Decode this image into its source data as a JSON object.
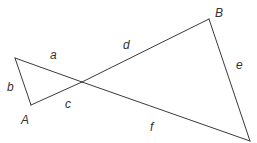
{
  "diagram": {
    "type": "crossed-triangles",
    "stroke_color": "#3a3a3a",
    "label_color": "#333333",
    "points": {
      "P": {
        "x": 15,
        "y": 58
      },
      "A": {
        "x": 31,
        "y": 105
      },
      "X": {
        "x": 82,
        "y": 82
      },
      "B": {
        "x": 209,
        "y": 19
      },
      "Q": {
        "x": 250,
        "y": 141
      }
    },
    "segments": [
      {
        "name": "a",
        "from": "P",
        "to": "X"
      },
      {
        "name": "b",
        "from": "P",
        "to": "A"
      },
      {
        "name": "c",
        "from": "A",
        "to": "X"
      },
      {
        "name": "d",
        "from": "X",
        "to": "B"
      },
      {
        "name": "e",
        "from": "B",
        "to": "Q"
      },
      {
        "name": "f",
        "from": "X",
        "to": "Q"
      }
    ],
    "labels": {
      "a": {
        "text": "a",
        "x": 50,
        "y": 59
      },
      "b": {
        "text": "b",
        "x": 7,
        "y": 91
      },
      "c": {
        "text": "c",
        "x": 65,
        "y": 108
      },
      "d": {
        "text": "d",
        "x": 123,
        "y": 49
      },
      "e": {
        "text": "e",
        "x": 236,
        "y": 69
      },
      "f": {
        "text": "f",
        "x": 150,
        "y": 131
      },
      "A": {
        "text": "A",
        "x": 21,
        "y": 124
      },
      "B": {
        "text": "B",
        "x": 215,
        "y": 17
      }
    }
  }
}
